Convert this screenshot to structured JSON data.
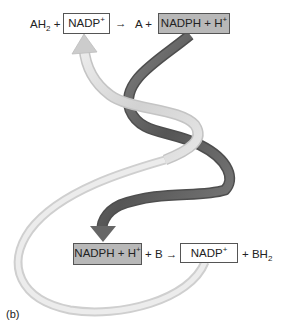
{
  "panel_label": "(b)",
  "top_equation": {
    "reactant1": "AH",
    "reactant1_sub": "2",
    "plus1": "+",
    "box1": {
      "text": "NADP",
      "sup": "+",
      "style": "light"
    },
    "arrow": "→",
    "product1": "A",
    "plus2": "+",
    "box2": {
      "text": "NADPH + H",
      "sup": "+",
      "style": "shaded"
    }
  },
  "bottom_equation": {
    "box1": {
      "text": "NADPH + H",
      "sup": "+",
      "style": "shaded"
    },
    "plus1": "+",
    "reactant2": "B",
    "arrow": "→",
    "box2": {
      "text": "NADP",
      "sup": "+",
      "style": "light"
    },
    "plus2": "+",
    "product2": "BH",
    "product2_sub": "2"
  },
  "ribbons": [
    {
      "name": "NADPH cycle",
      "from": "top NADPH + H+",
      "to": "bottom NADPH + H+",
      "color": "#6e6e6e"
    },
    {
      "name": "NADP+ cycle",
      "from": "bottom NADP+",
      "to": "top NADP+",
      "color": "#d6d6d6"
    }
  ]
}
